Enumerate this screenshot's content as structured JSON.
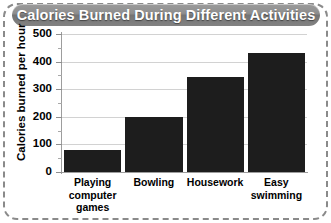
{
  "title": "Calories Burned During Different Activities",
  "chart_data": {
    "type": "bar",
    "title": "Calories Burned During Different Activities",
    "xlabel": "",
    "ylabel": "Calories burned per hour",
    "categories": [
      "Playing computer games",
      "Bowling",
      "Housework",
      "Easy swimming"
    ],
    "values": [
      80,
      200,
      345,
      430
    ],
    "ylim": [
      0,
      500
    ],
    "ytick_labels": [
      "0",
      "100",
      "200",
      "300",
      "400",
      "500"
    ],
    "ytick_values": [
      0,
      100,
      200,
      300,
      400,
      500
    ],
    "minor_tick_values": [
      50,
      150,
      250,
      350,
      450
    ],
    "grid": true,
    "legend": "none",
    "bar_color": "#1d1d1d",
    "gridline_color": "#d2d2d2",
    "title_bar_color": "#878787",
    "title_text_color": "#ffffff",
    "frame_color": "#8a8a8a"
  },
  "category_lines": [
    [
      "Playing",
      "computer",
      "games"
    ],
    [
      "Bowling"
    ],
    [
      "Housework"
    ],
    [
      "Easy",
      "swimming"
    ]
  ]
}
